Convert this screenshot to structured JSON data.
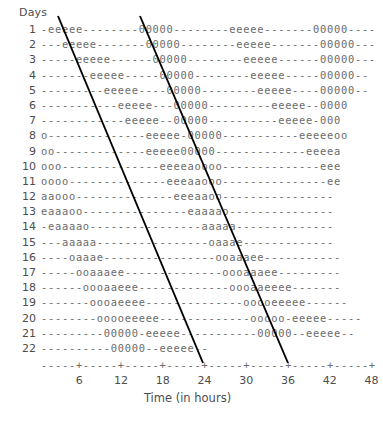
{
  "figure": {
    "y_axis_title": "Days",
    "x_axis_title": "Time (in hours)",
    "caption": "",
    "line_color": "#000000",
    "text_color": "#5a5a5a",
    "background": "#ffffff",
    "axis_row": "-----+-----+-----+-----+-----+-----+-----+-----+",
    "xticks": [
      "6",
      "12",
      "18",
      "24",
      "30",
      "36",
      "42",
      "48"
    ],
    "rows": [
      {
        "day": "1",
        "pattern": "-eeeee--------00000--------eeeee-------00000----"
      },
      {
        "day": "2",
        "pattern": "---eeeee-------00000--------eeeee-------00000---"
      },
      {
        "day": "3",
        "pattern": "-----eeeee------00000--------eeeee------00000---"
      },
      {
        "day": "4",
        "pattern": "-------eeeee-----00000--------eeeee-----00000--"
      },
      {
        "day": "5",
        "pattern": "---------eeeee----00000--------eeeee----00000--"
      },
      {
        "day": "6",
        "pattern": "-----------eeeee---00000---------eeeee--0000"
      },
      {
        "day": "7",
        "pattern": "------------eeeee--00000----------eeeee-000"
      },
      {
        "day": "8",
        "pattern": "o--------------eeeee-00000-----------eeeeeoo"
      },
      {
        "day": "9",
        "pattern": "oo-------------eeeee00000-------------eeeea"
      },
      {
        "day": "10",
        "pattern": "ooo--------------eeeeaoooo--------------eee"
      },
      {
        "day": "11",
        "pattern": "oooo--------------eeeaaooo---------------ee"
      },
      {
        "day": "12",
        "pattern": "aaooo--------------eeeaaoo----------------"
      },
      {
        "day": "13",
        "pattern": "eaaaoo---------------eaaaao---------------"
      },
      {
        "day": "14",
        "pattern": "-eaaaao----------------aaaaa--------------"
      },
      {
        "day": "15",
        "pattern": "---aaaaa----------------oaaae-------------"
      },
      {
        "day": "16",
        "pattern": "----oaaae----------------ooaaaee-----------"
      },
      {
        "day": "17",
        "pattern": "-----ooaaaee--------------oooaaaee---------"
      },
      {
        "day": "18",
        "pattern": "------oooaaeee-------------oooaaeeee-------"
      },
      {
        "day": "19",
        "pattern": "-------oooaeeee--------------ooooeeeee------"
      },
      {
        "day": "20",
        "pattern": "--------ooooeeeee-------------ooooo-eeeee-----"
      },
      {
        "day": "21",
        "pattern": "---------00000-eeeee-----------00000--eeeee--"
      },
      {
        "day": "22",
        "pattern": "----------00000--eeeee--"
      }
    ],
    "trend_lines": [
      {
        "name": "onset-trend-line",
        "x1": 58,
        "y1": 16,
        "x2": 203,
        "y2": 363
      },
      {
        "name": "offset-trend-line",
        "x1": 140,
        "y1": 16,
        "x2": 288,
        "y2": 363
      }
    ]
  }
}
